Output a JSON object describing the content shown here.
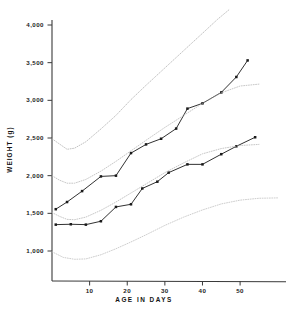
{
  "chart_data": {
    "type": "line",
    "title": "",
    "xlabel": "AGE IN DAYS",
    "ylabel": "WEIGHT (g)",
    "xlim": [
      0,
      62
    ],
    "ylim": [
      800,
      4150
    ],
    "grid": false,
    "legend": "none",
    "xticks": [
      "10",
      "20",
      "30",
      "40",
      "50"
    ],
    "xtick_values": [
      10,
      20,
      30,
      40,
      50
    ],
    "yticks": [
      "1,000",
      "1,500",
      "2,000",
      "2,500",
      "3,000",
      "3,500",
      "4,000"
    ],
    "ytick_values": [
      1000,
      1500,
      2000,
      2500,
      3000,
      3500,
      4000
    ],
    "series": [
      {
        "name": "upper-measured-infant",
        "style": "solid-with-square-markers",
        "color": "#1a1a1a",
        "points": [
          [
            1,
            1555
          ],
          [
            4,
            1650
          ],
          [
            8,
            1795
          ],
          [
            13,
            1990
          ],
          [
            17,
            2000
          ],
          [
            21,
            2300
          ],
          [
            25,
            2415
          ],
          [
            29,
            2490
          ],
          [
            33,
            2625
          ],
          [
            36,
            2890
          ],
          [
            40,
            2960
          ],
          [
            45,
            3105
          ],
          [
            49,
            3310
          ],
          [
            52,
            3530
          ]
        ]
      },
      {
        "name": "lower-measured-infant",
        "style": "solid-with-square-markers",
        "color": "#1a1a1a",
        "points": [
          [
            1,
            1350
          ],
          [
            5,
            1355
          ],
          [
            9,
            1350
          ],
          [
            13,
            1395
          ],
          [
            17,
            1585
          ],
          [
            21,
            1620
          ],
          [
            24,
            1830
          ],
          [
            28,
            1920
          ],
          [
            31,
            2040
          ],
          [
            36,
            2150
          ],
          [
            40,
            2150
          ],
          [
            45,
            2285
          ],
          [
            49,
            2390
          ],
          [
            54,
            2510
          ]
        ]
      },
      {
        "name": "reference-percentile-top",
        "style": "dotted",
        "color": "#aeaeae",
        "points": [
          [
            0,
            2490
          ],
          [
            2,
            2420
          ],
          [
            4,
            2350
          ],
          [
            6,
            2365
          ],
          [
            9,
            2450
          ],
          [
            13,
            2620
          ],
          [
            17,
            2800
          ],
          [
            21,
            3010
          ],
          [
            25,
            3200
          ],
          [
            30,
            3430
          ],
          [
            35,
            3660
          ],
          [
            40,
            3890
          ],
          [
            44,
            4075
          ],
          [
            47,
            4200
          ]
        ]
      },
      {
        "name": "reference-percentile-upper-mid",
        "style": "dotted",
        "color": "#b4b4b4",
        "points": [
          [
            0,
            2000
          ],
          [
            2,
            1940
          ],
          [
            4,
            1900
          ],
          [
            6,
            1900
          ],
          [
            9,
            1950
          ],
          [
            13,
            2060
          ],
          [
            17,
            2190
          ],
          [
            21,
            2330
          ],
          [
            25,
            2470
          ],
          [
            30,
            2640
          ],
          [
            35,
            2800
          ],
          [
            40,
            2960
          ],
          [
            45,
            3100
          ],
          [
            50,
            3190
          ],
          [
            55,
            3215
          ]
        ]
      },
      {
        "name": "reference-percentile-lower-mid",
        "style": "dotted",
        "color": "#b4b4b4",
        "points": [
          [
            0,
            1510
          ],
          [
            2,
            1460
          ],
          [
            4,
            1420
          ],
          [
            6,
            1415
          ],
          [
            9,
            1450
          ],
          [
            13,
            1540
          ],
          [
            17,
            1650
          ],
          [
            21,
            1770
          ],
          [
            25,
            1890
          ],
          [
            30,
            2040
          ],
          [
            35,
            2170
          ],
          [
            40,
            2290
          ],
          [
            45,
            2360
          ],
          [
            50,
            2400
          ],
          [
            55,
            2415
          ]
        ]
      },
      {
        "name": "reference-percentile-bottom",
        "style": "dotted",
        "color": "#bcbcbc",
        "points": [
          [
            0,
            990
          ],
          [
            3,
            915
          ],
          [
            6,
            890
          ],
          [
            9,
            895
          ],
          [
            13,
            950
          ],
          [
            17,
            1030
          ],
          [
            21,
            1120
          ],
          [
            25,
            1215
          ],
          [
            30,
            1340
          ],
          [
            35,
            1450
          ],
          [
            40,
            1545
          ],
          [
            45,
            1625
          ],
          [
            50,
            1675
          ],
          [
            55,
            1700
          ],
          [
            60,
            1705
          ]
        ]
      }
    ]
  },
  "axes": {
    "x_title": "AGE IN DAYS",
    "y_title": "WEIGHT (g)"
  }
}
